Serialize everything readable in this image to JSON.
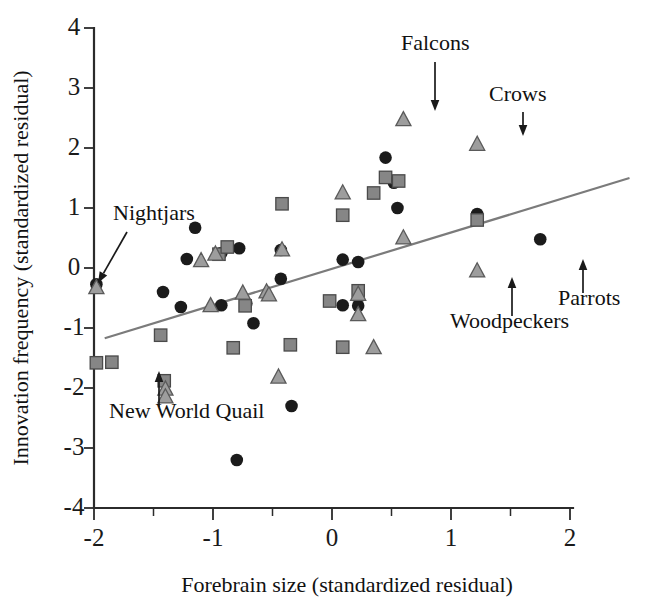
{
  "chart_data": {
    "type": "scatter",
    "title": "",
    "xlabel": "Forebrain size (standardized residual)",
    "ylabel": "Innovation frequency (standardized residual)",
    "xlim": [
      -2,
      2
    ],
    "ylim": [
      -4,
      4
    ],
    "xticks": [
      -2,
      -1,
      0,
      1,
      2
    ],
    "xtick_labels": [
      "-2",
      "-1",
      "0",
      "1",
      "2"
    ],
    "xticks_minor": [
      -1.5,
      -0.5,
      0.5,
      1.5
    ],
    "yticks": [
      -4,
      -3,
      -2,
      -1,
      0,
      1,
      2,
      3,
      4
    ],
    "ytick_labels": [
      "-4",
      "-3",
      "-2",
      "-1",
      "0",
      "1",
      "2",
      "3",
      "4"
    ],
    "grid": false,
    "legend": "none",
    "trendline": {
      "x0": -1.91,
      "y0": -1.17,
      "x1": 2.5,
      "y1": 1.5,
      "color": "#7b7b7b"
    },
    "series": [
      {
        "name": "circle",
        "marker": "circle",
        "color": "#1b1b1b",
        "points": [
          [
            -1.98,
            -0.27
          ],
          [
            -1.42,
            -0.4
          ],
          [
            -1.22,
            0.15
          ],
          [
            -1.15,
            0.67
          ],
          [
            -1.27,
            -0.65
          ],
          [
            -0.93,
            0.25
          ],
          [
            -0.78,
            0.33
          ],
          [
            -0.93,
            -0.62
          ],
          [
            -0.72,
            -0.59
          ],
          [
            -0.66,
            -0.92
          ],
          [
            -0.43,
            0.3
          ],
          [
            -0.43,
            -0.18
          ],
          [
            -0.34,
            -2.3
          ],
          [
            -0.8,
            -3.2
          ],
          [
            0.09,
            0.14
          ],
          [
            0.09,
            -0.62
          ],
          [
            0.22,
            0.1
          ],
          [
            0.22,
            -0.63
          ],
          [
            0.45,
            1.84
          ],
          [
            0.52,
            1.42
          ],
          [
            0.55,
            1.0
          ],
          [
            1.22,
            0.9
          ],
          [
            1.75,
            0.48
          ]
        ]
      },
      {
        "name": "square",
        "marker": "square",
        "color": "#868686",
        "points": [
          [
            -1.98,
            -1.58
          ],
          [
            -1.85,
            -1.57
          ],
          [
            -1.44,
            -1.12
          ],
          [
            -1.41,
            -1.88
          ],
          [
            -0.95,
            0.23
          ],
          [
            -0.88,
            0.35
          ],
          [
            -0.73,
            -0.63
          ],
          [
            -0.42,
            1.07
          ],
          [
            -0.35,
            -1.28
          ],
          [
            -0.83,
            -1.33
          ],
          [
            0.09,
            0.88
          ],
          [
            0.09,
            -1.32
          ],
          [
            0.35,
            1.25
          ],
          [
            0.45,
            1.51
          ],
          [
            0.56,
            1.45
          ],
          [
            1.22,
            0.8
          ],
          [
            0.22,
            -0.38
          ],
          [
            -0.02,
            -0.55
          ]
        ]
      },
      {
        "name": "triangle",
        "marker": "triangle",
        "color": "#9d9d9d",
        "points": [
          [
            -1.98,
            -0.33
          ],
          [
            -1.4,
            -2.02
          ],
          [
            -1.4,
            -2.15
          ],
          [
            -1.1,
            0.12
          ],
          [
            -1.02,
            -0.63
          ],
          [
            -0.98,
            0.23
          ],
          [
            -0.75,
            -0.42
          ],
          [
            -0.55,
            -0.4
          ],
          [
            -0.53,
            -0.45
          ],
          [
            -0.45,
            -1.82
          ],
          [
            -0.42,
            0.3
          ],
          [
            0.09,
            1.25
          ],
          [
            0.22,
            -0.44
          ],
          [
            0.22,
            -0.78
          ],
          [
            0.35,
            -1.33
          ],
          [
            0.6,
            0.5
          ],
          [
            0.6,
            2.47
          ],
          [
            1.22,
            2.06
          ],
          [
            1.22,
            -0.05
          ]
        ]
      }
    ],
    "annotations": [
      {
        "id": "nightjars",
        "label": "Nightjars",
        "label_x": 113,
        "label_y": 220,
        "arrow_from_x": 127,
        "arrow_from_y": 232,
        "arrow_to_x": 98,
        "arrow_to_y": 283
      },
      {
        "id": "new-world-quail",
        "label": "New World Quail",
        "label_x": 109,
        "label_y": 418,
        "arrow_from_x": 159,
        "arrow_from_y": 407,
        "arrow_to_x": 159,
        "arrow_to_y": 371
      },
      {
        "id": "falcons",
        "label": "Falcons",
        "label_x": 401,
        "label_y": 50,
        "arrow_from_x": 435,
        "arrow_from_y": 62,
        "arrow_to_x": 435,
        "arrow_to_y": 111
      },
      {
        "id": "crows",
        "label": "Crows",
        "label_x": 489,
        "label_y": 101,
        "arrow_from_x": 523,
        "arrow_from_y": 112,
        "arrow_to_x": 523,
        "arrow_to_y": 136
      },
      {
        "id": "woodpeckers",
        "label": "Woodpeckers",
        "label_x": 450,
        "label_y": 328,
        "arrow_from_x": 512,
        "arrow_from_y": 316,
        "arrow_to_x": 512,
        "arrow_to_y": 277
      },
      {
        "id": "parrots",
        "label": "Parrots",
        "label_x": 558,
        "label_y": 305,
        "arrow_from_x": 583,
        "arrow_from_y": 293,
        "arrow_to_x": 583,
        "arrow_to_y": 259
      }
    ]
  }
}
